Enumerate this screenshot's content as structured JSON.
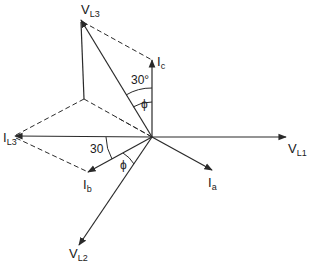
{
  "diagram": {
    "type": "phasor-diagram",
    "origin": {
      "x": 152,
      "y": 137
    },
    "colors": {
      "line": "#2a2a2a",
      "background": "#ffffff"
    },
    "phasors": [
      {
        "id": "VL1",
        "main": "V",
        "sub": "L1",
        "tip": {
          "x": 286,
          "y": 137
        }
      },
      {
        "id": "VL2",
        "main": "V",
        "sub": "L2",
        "tip": {
          "x": 79,
          "y": 245
        }
      },
      {
        "id": "VL3",
        "main": "V",
        "sub": "L3",
        "tip": {
          "x": 81,
          "y": 20
        }
      },
      {
        "id": "Ia",
        "main": "I",
        "sub": "a",
        "tip": {
          "x": 212,
          "y": 170
        }
      },
      {
        "id": "Ib",
        "main": "I",
        "sub": "b",
        "tip": {
          "x": 88,
          "y": 172
        }
      },
      {
        "id": "Ic",
        "main": "I",
        "sub": "c",
        "tip": {
          "x": 152,
          "y": 60
        }
      },
      {
        "id": "IL3",
        "main": "I",
        "sub": "L3",
        "tip": {
          "x": 15,
          "y": 136
        }
      }
    ],
    "angles": [
      {
        "label": "30°",
        "between": [
          "VL3",
          "Ic"
        ]
      },
      {
        "label": "ϕ",
        "between": [
          "VL3",
          "Ic"
        ]
      },
      {
        "label": "30",
        "between": [
          "IL3",
          "Ib"
        ]
      },
      {
        "label": "ϕ",
        "between": [
          "Ib",
          "VL2"
        ]
      }
    ],
    "labels": {
      "VL1_main": "V",
      "VL1_sub": "L1",
      "VL2_main": "V",
      "VL2_sub": "L2",
      "VL3_main": "V",
      "VL3_sub": "L3",
      "Ia_main": "I",
      "Ia_sub": "a",
      "Ib_main": "I",
      "Ib_sub": "b",
      "Ic_main": "I",
      "Ic_sub": "c",
      "IL3_main": "I",
      "IL3_sub": "L3",
      "angle_30deg": "30°",
      "angle_phi_top": "ϕ",
      "angle_30": "30",
      "angle_phi_bottom": "ϕ"
    }
  }
}
